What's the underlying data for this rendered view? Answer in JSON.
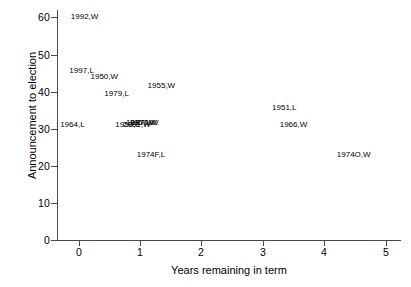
{
  "chart_data": {
    "type": "scatter",
    "title": "",
    "xlabel": "Years remaining in term",
    "ylabel": "Announcement to election",
    "xlim": [
      -0.35,
      5.25
    ],
    "ylim": [
      0,
      62
    ],
    "xticks": [
      0,
      1,
      2,
      3,
      4,
      5
    ],
    "yticks": [
      0,
      10,
      20,
      30,
      40,
      50,
      60
    ],
    "xtick_labels": [
      "0",
      "1",
      "2",
      "3",
      "4",
      "5"
    ],
    "ytick_labels": [
      "0",
      "10",
      "20",
      "30",
      "40",
      "50",
      "60"
    ],
    "grid": false,
    "legend": false,
    "marker_style": "text-label-only",
    "points": [
      {
        "label": "1992,W",
        "x": 0.1,
        "y": 60.0
      },
      {
        "label": "1997,L",
        "x": 0.05,
        "y": 45.5
      },
      {
        "label": "1950,W",
        "x": 0.42,
        "y": 44.0
      },
      {
        "label": "1955,W",
        "x": 1.35,
        "y": 41.5
      },
      {
        "label": "1979,L",
        "x": 0.62,
        "y": 39.5
      },
      {
        "label": "1951,L",
        "x": 3.35,
        "y": 35.5
      },
      {
        "label": "1964,L",
        "x": -0.1,
        "y": 31.0
      },
      {
        "label": "1958,L",
        "x": 0.8,
        "y": 31.0
      },
      {
        "label": "2001,W",
        "x": 0.95,
        "y": 31.0
      },
      {
        "label": "1987,W",
        "x": 1.0,
        "y": 31.5
      },
      {
        "label": "1957,W",
        "x": 1.05,
        "y": 31.5
      },
      {
        "label": "1970,W",
        "x": 1.08,
        "y": 31.5
      },
      {
        "label": "1966,W",
        "x": 3.5,
        "y": 31.0
      },
      {
        "label": "1974F,L",
        "x": 1.18,
        "y": 23.0
      },
      {
        "label": "1974O,W",
        "x": 4.48,
        "y": 23.0
      }
    ]
  }
}
